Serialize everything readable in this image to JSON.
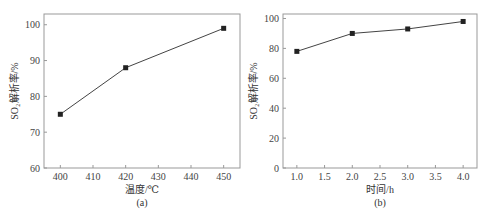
{
  "chart_data": [
    {
      "type": "line",
      "panel_label": "(a)",
      "title": "",
      "xlabel": "温度/℃",
      "ylabel": "SO₂解析率/%",
      "x": [
        400,
        420,
        450
      ],
      "series": [
        {
          "name": "SO₂解析率",
          "values": [
            75,
            88,
            99
          ],
          "marker": "square",
          "color": "#333333"
        }
      ],
      "xlim": [
        395,
        455
      ],
      "ylim": [
        60,
        103
      ],
      "xticks": [
        400,
        410,
        420,
        430,
        440,
        450
      ],
      "yticks": [
        60,
        70,
        80,
        90,
        100
      ],
      "grid": false,
      "legend": null
    },
    {
      "type": "line",
      "panel_label": "(b)",
      "title": "",
      "xlabel": "时间/h",
      "ylabel": "SO₂解析率/%",
      "x": [
        1.0,
        2.0,
        3.0,
        4.0
      ],
      "series": [
        {
          "name": "SO₂解析率",
          "values": [
            78,
            90,
            93,
            98
          ],
          "marker": "square",
          "color": "#333333"
        }
      ],
      "xlim": [
        0.75,
        4.25
      ],
      "ylim": [
        0,
        103
      ],
      "xticks": [
        "1.0",
        "1.5",
        "2.0",
        "2.5",
        "3.0",
        "3.5",
        "4.0"
      ],
      "yticks": [
        0,
        20,
        40,
        60,
        80,
        100
      ],
      "grid": false,
      "legend": null
    }
  ],
  "labels": {
    "a": {
      "xlabel": "温度/℃",
      "ylabel": "SO₂解析率/%",
      "panel": "(a)"
    },
    "b": {
      "xlabel": "时间/h",
      "ylabel": "SO₂解析率/%",
      "panel": "(b)"
    }
  }
}
